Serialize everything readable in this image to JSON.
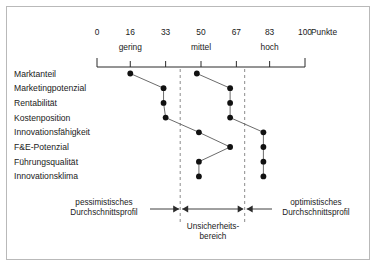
{
  "chart_data": {
    "type": "line",
    "title": "",
    "xlabel": "Punkte",
    "ylabel": "",
    "xlim": [
      0,
      100
    ],
    "grid": false,
    "legend_position": "bottom",
    "orientation": "horizontal",
    "axis": {
      "tick_values": [
        0,
        16,
        33,
        50,
        67,
        83,
        100
      ],
      "tick_labels": [
        "0",
        "16",
        "33",
        "50",
        "67",
        "83",
        "100"
      ],
      "unit_label": "Punkte",
      "bands": [
        {
          "label": "gering",
          "from": 0,
          "to": 33,
          "center": 16
        },
        {
          "label": "mittel",
          "from": 33,
          "to": 67,
          "center": 50
        },
        {
          "label": "hoch",
          "from": 67,
          "to": 100,
          "center": 83
        }
      ]
    },
    "categories": [
      "Marktanteil",
      "Marketingpotenzial",
      "Rentabilität",
      "Kostenposition",
      "Innovationsfähigkeit",
      "F&E-Potenzial",
      "Führungsqualität",
      "Innovationsklima"
    ],
    "series": [
      {
        "name": "pessimistisches Durchschnittsprofil",
        "values": [
          16,
          32,
          32,
          33,
          49,
          64,
          49,
          49
        ]
      },
      {
        "name": "optimistisches Durchschnittsprofil",
        "values": [
          48,
          64,
          64,
          64,
          80,
          80,
          80,
          80
        ]
      }
    ],
    "uncertainty_band": {
      "label_line1": "Unsicherheits-",
      "label_line2": "bereich",
      "from": 40,
      "to": 71
    },
    "annotations": {
      "left_line1": "pessimistisches",
      "left_line2": "Durchschnittsprofil",
      "right_line1": "optimistisches",
      "right_line2": "Durchschnittsprofil"
    },
    "colors": {
      "marker": "#111111",
      "line": "#5a5a5a",
      "axis": "#2b2b2b",
      "dashed": "#8c8c8c",
      "border": "#b9b9b9",
      "text": "#1a1a1a",
      "background": "#ffffff"
    }
  }
}
